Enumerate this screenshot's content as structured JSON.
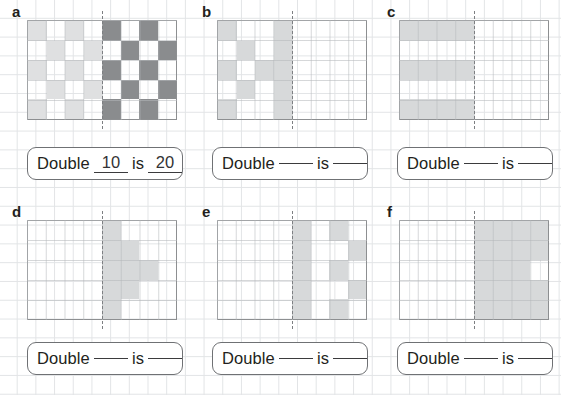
{
  "worksheet": {
    "title": "Double the pattern worksheet",
    "colors": {
      "light_shade": "#dfe0e1",
      "mid_shade": "#d7d9da",
      "dark_shade": "#8a8c8e",
      "grid_line": "#e2e4e6",
      "figure_border": "#8d8f91",
      "text": "#231f20"
    },
    "prompt": {
      "word_double": "Double",
      "word_is": "is",
      "blank": ""
    },
    "panels": [
      {
        "letter": "a",
        "grid": {
          "cols": 8,
          "rows": 5
        },
        "answer": {
          "first": "10",
          "second": "20",
          "filled": true
        },
        "cells": [
          [
            "light",
            "none",
            "light",
            "none",
            "dark",
            "none",
            "dark",
            "none"
          ],
          [
            "none",
            "light",
            "none",
            "light",
            "none",
            "dark",
            "none",
            "dark"
          ],
          [
            "light",
            "none",
            "light",
            "none",
            "dark",
            "none",
            "dark",
            "none"
          ],
          [
            "none",
            "light",
            "none",
            "light",
            "none",
            "dark",
            "none",
            "dark"
          ],
          [
            "light",
            "none",
            "light",
            "none",
            "dark",
            "none",
            "dark",
            "none"
          ]
        ]
      },
      {
        "letter": "b",
        "grid": {
          "cols": 8,
          "rows": 5
        },
        "answer": {
          "first": "",
          "second": "",
          "filled": false
        },
        "cells": [
          [
            "mid",
            "none",
            "none",
            "mid",
            "none",
            "none",
            "none",
            "none"
          ],
          [
            "none",
            "mid",
            "none",
            "mid",
            "none",
            "none",
            "none",
            "none"
          ],
          [
            "mid",
            "none",
            "mid",
            "mid",
            "none",
            "none",
            "none",
            "none"
          ],
          [
            "none",
            "mid",
            "none",
            "mid",
            "none",
            "none",
            "none",
            "none"
          ],
          [
            "mid",
            "none",
            "none",
            "mid",
            "none",
            "none",
            "none",
            "none"
          ]
        ]
      },
      {
        "letter": "c",
        "grid": {
          "cols": 8,
          "rows": 5
        },
        "answer": {
          "first": "",
          "second": "",
          "filled": false
        },
        "cells": [
          [
            "mid",
            "mid",
            "mid",
            "mid",
            "none",
            "none",
            "none",
            "none"
          ],
          [
            "none",
            "none",
            "none",
            "none",
            "none",
            "none",
            "none",
            "none"
          ],
          [
            "mid",
            "mid",
            "mid",
            "mid",
            "none",
            "none",
            "none",
            "none"
          ],
          [
            "none",
            "none",
            "none",
            "none",
            "none",
            "none",
            "none",
            "none"
          ],
          [
            "mid",
            "mid",
            "mid",
            "mid",
            "none",
            "none",
            "none",
            "none"
          ]
        ]
      },
      {
        "letter": "d",
        "grid": {
          "cols": 8,
          "rows": 5
        },
        "answer": {
          "first": "",
          "second": "",
          "filled": false
        },
        "cells": [
          [
            "none",
            "none",
            "none",
            "none",
            "mid",
            "none",
            "none",
            "none"
          ],
          [
            "none",
            "none",
            "none",
            "none",
            "mid",
            "mid",
            "none",
            "none"
          ],
          [
            "none",
            "none",
            "none",
            "none",
            "mid",
            "mid",
            "mid",
            "none"
          ],
          [
            "none",
            "none",
            "none",
            "none",
            "mid",
            "mid",
            "none",
            "none"
          ],
          [
            "none",
            "none",
            "none",
            "none",
            "mid",
            "none",
            "none",
            "none"
          ]
        ]
      },
      {
        "letter": "e",
        "grid": {
          "cols": 8,
          "rows": 5
        },
        "answer": {
          "first": "",
          "second": "",
          "filled": false
        },
        "cells": [
          [
            "none",
            "none",
            "none",
            "none",
            "mid",
            "none",
            "mid",
            "none"
          ],
          [
            "none",
            "none",
            "none",
            "none",
            "mid",
            "none",
            "none",
            "mid"
          ],
          [
            "none",
            "none",
            "none",
            "none",
            "mid",
            "none",
            "mid",
            "none"
          ],
          [
            "none",
            "none",
            "none",
            "none",
            "mid",
            "none",
            "none",
            "mid"
          ],
          [
            "none",
            "none",
            "none",
            "none",
            "mid",
            "none",
            "mid",
            "none"
          ]
        ]
      },
      {
        "letter": "f",
        "grid": {
          "cols": 8,
          "rows": 5
        },
        "answer": {
          "first": "",
          "second": "",
          "filled": false
        },
        "cells": [
          [
            "none",
            "none",
            "none",
            "none",
            "mid",
            "mid",
            "mid",
            "mid"
          ],
          [
            "none",
            "none",
            "none",
            "none",
            "mid",
            "mid",
            "mid",
            "mid"
          ],
          [
            "none",
            "none",
            "none",
            "none",
            "mid",
            "mid",
            "mid",
            "none"
          ],
          [
            "none",
            "none",
            "none",
            "none",
            "mid",
            "mid",
            "mid",
            "mid"
          ],
          [
            "none",
            "none",
            "none",
            "none",
            "mid",
            "mid",
            "mid",
            "mid"
          ]
        ]
      }
    ]
  }
}
